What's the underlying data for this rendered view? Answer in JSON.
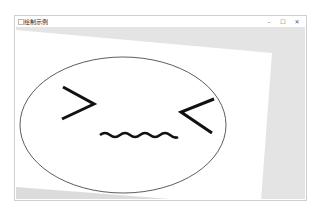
{
  "window": {
    "title": "绘制示例",
    "controls": {
      "minimize": "–",
      "maximize": "☐",
      "close": "✕"
    }
  },
  "canvas": {
    "background_color": "#e4e4e4",
    "rotated_rect_color": "#ffffff",
    "face": {
      "outline_color": "#333333",
      "feature_color": "#111111",
      "left_eye": ">",
      "right_eye": "<",
      "mouth": "wavy-line"
    }
  }
}
